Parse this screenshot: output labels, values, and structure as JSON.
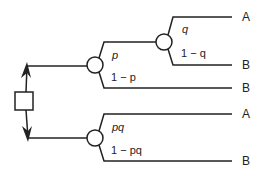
{
  "diagram": {
    "type": "decision-tree",
    "colors": {
      "line": "#222222",
      "background": "#ffffff"
    },
    "decision_node": {
      "shape": "square"
    },
    "upper_branch": {
      "chance_node_1": {
        "branches": [
          {
            "prob": "p"
          },
          {
            "prob": "1 − p",
            "outcome": "B"
          }
        ]
      },
      "chance_node_2": {
        "branches": [
          {
            "prob": "q",
            "outcome": "A"
          },
          {
            "prob": "1 − q",
            "outcome": "B"
          }
        ]
      }
    },
    "lower_branch": {
      "chance_node_3": {
        "branches": [
          {
            "prob": "pq",
            "outcome": "A"
          },
          {
            "prob": "1 − pq",
            "outcome": "B"
          }
        ]
      }
    }
  }
}
